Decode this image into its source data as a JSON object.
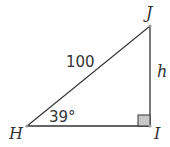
{
  "diagram": {
    "type": "right-triangle",
    "vertices": {
      "H": {
        "label": "H",
        "x": 27,
        "y": 126
      },
      "I": {
        "label": "I",
        "x": 150,
        "y": 126
      },
      "J": {
        "label": "J",
        "x": 150,
        "y": 26
      }
    },
    "hypotenuse_label": "100",
    "opposite_label": "h",
    "angle_label": "39°",
    "right_angle_at": "I",
    "colors": {
      "stroke": "#333333",
      "vertex_dot": "#999999",
      "right_angle_fill": "#c8c8c8"
    }
  }
}
